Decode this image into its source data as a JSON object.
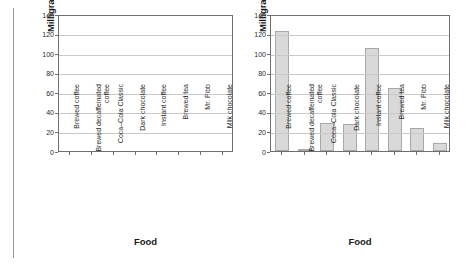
{
  "figure": {
    "panels": [
      {
        "name": "empty-template-chart",
        "xlabel": "Food",
        "ylabel": "Milligrams of Caffeine"
      },
      {
        "name": "caffeine-bar-chart",
        "xlabel": "Food",
        "ylabel": "Milligrams of Caffeine"
      }
    ]
  },
  "chart_data": [
    {
      "type": "bar",
      "title": "",
      "xlabel": "Food",
      "ylabel": "Milligrams of Caffeine",
      "categories": [
        "Brewed coffee",
        "Brewed decaffeinated\ncoffee",
        "Coca–Cola Classic",
        "Dark chocolate",
        "Instant coffee",
        "Brewed tea",
        "Mr. Pibb",
        "Milk chocolate"
      ],
      "values": [
        null,
        null,
        null,
        null,
        null,
        null,
        null,
        null
      ],
      "ylim": [
        0,
        140
      ],
      "yticks": [
        0,
        20,
        40,
        60,
        80,
        100,
        120,
        140
      ],
      "grid": true,
      "legend": "none",
      "note": "blank axes template – no bars drawn"
    },
    {
      "type": "bar",
      "title": "",
      "xlabel": "Food",
      "ylabel": "Milligrams of Caffeine",
      "categories": [
        "Brewed coffee",
        "Brewed decaffeinated\ncoffee",
        "Coca–Cola Classic",
        "Dark chocolate",
        "Instant coffee",
        "Brewed tea",
        "Mr. Pibb",
        "Milk chocolate"
      ],
      "values": [
        123,
        2,
        29,
        28,
        105,
        64,
        24,
        8
      ],
      "ylim": [
        0,
        140
      ],
      "yticks": [
        0,
        20,
        40,
        60,
        80,
        100,
        120,
        140
      ],
      "grid": true,
      "legend": "none",
      "bar_color": "#d9d9d9",
      "bar_edge_color": "#a8a8a8"
    }
  ]
}
